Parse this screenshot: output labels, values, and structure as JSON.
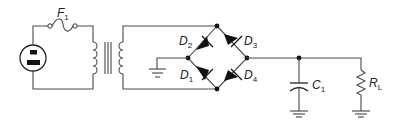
{
  "diagram": {
    "type": "circuit-schematic",
    "colors": {
      "wire": "#4a4a4a",
      "fill": "#111111",
      "background": "#ffffff"
    },
    "components": {
      "outlet": {
        "label": "",
        "icon": "ac-outlet-icon"
      },
      "fuse": {
        "letter": "F",
        "sub": "1"
      },
      "transformer": {
        "label": ""
      },
      "d1": {
        "letter": "D",
        "sub": "1"
      },
      "d2": {
        "letter": "D",
        "sub": "2"
      },
      "d3": {
        "letter": "D",
        "sub": "3"
      },
      "d4": {
        "letter": "D",
        "sub": "4"
      },
      "c1": {
        "letter": "C",
        "sub": "1"
      },
      "rl": {
        "letter": "R",
        "sub": "L"
      }
    }
  }
}
